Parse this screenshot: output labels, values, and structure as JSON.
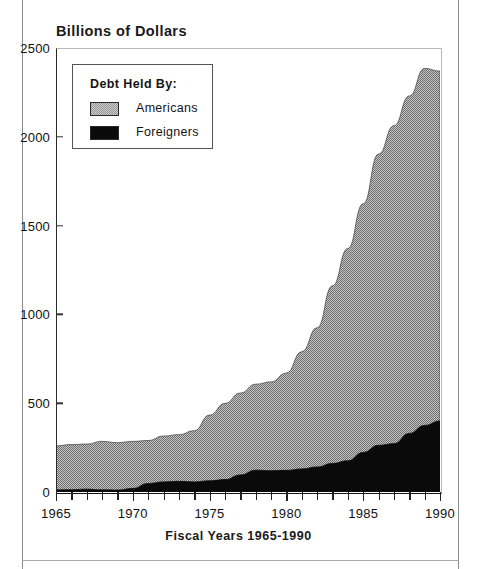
{
  "page": {
    "title": "Billions of Dollars"
  },
  "chart_data": {
    "type": "area",
    "stacked": true,
    "title": "Billions of Dollars",
    "xlabel": "Fiscal Years 1965-1990",
    "ylabel": "Billions of Dollars",
    "xlim": [
      1965,
      1990
    ],
    "ylim": [
      0,
      2500
    ],
    "grid": false,
    "legend_position": "top-left",
    "legend_title": "Debt Held By:",
    "x": [
      1965,
      1966,
      1967,
      1968,
      1969,
      1970,
      1971,
      1972,
      1973,
      1974,
      1975,
      1976,
      1977,
      1978,
      1979,
      1980,
      1981,
      1982,
      1983,
      1984,
      1985,
      1986,
      1987,
      1988,
      1989,
      1990
    ],
    "xtick_labels": [
      "1965",
      "1970",
      "1975",
      "1980",
      "1985",
      "1990"
    ],
    "xtick_values": [
      1965,
      1970,
      1975,
      1980,
      1985,
      1990
    ],
    "ytick_labels": [
      "0",
      "500",
      "1000",
      "1500",
      "2000",
      "2500"
    ],
    "ytick_values": [
      0,
      500,
      1000,
      1500,
      2000,
      2500
    ],
    "series": [
      {
        "name": "Foreigners",
        "color": "#0a0a0a",
        "values": [
          12,
          13,
          16,
          12,
          11,
          20,
          48,
          57,
          60,
          57,
          63,
          70,
          96,
          123,
          120,
          122,
          130,
          141,
          161,
          176,
          223,
          263,
          272,
          330,
          375,
          400
        ]
      },
      {
        "name": "Americans",
        "color": "#9a9a9a",
        "values": [
          248,
          254,
          254,
          273,
          267,
          265,
          242,
          258,
          263,
          288,
          370,
          429,
          461,
          484,
          500,
          548,
          660,
          784,
          1000,
          1195,
          1400,
          1640,
          1790,
          1900,
          2010,
          1970
        ]
      }
    ],
    "totals": [
      260,
      267,
      270,
      285,
      278,
      285,
      290,
      315,
      323,
      345,
      433,
      499,
      557,
      607,
      620,
      670,
      790,
      925,
      1161,
      1371,
      1623,
      1903,
      2062,
      2230,
      2385,
      2370
    ]
  },
  "legend": {
    "title": "Debt Held By:",
    "items": [
      {
        "label": "Americans",
        "swatch": "gray"
      },
      {
        "label": "Foreigners",
        "swatch": "black"
      }
    ]
  },
  "axis": {
    "x_title": "Fiscal Years 1965-1990"
  },
  "colors": {
    "americans": "#9a9a9a",
    "foreigners": "#0a0a0a",
    "axis": "#111111"
  }
}
